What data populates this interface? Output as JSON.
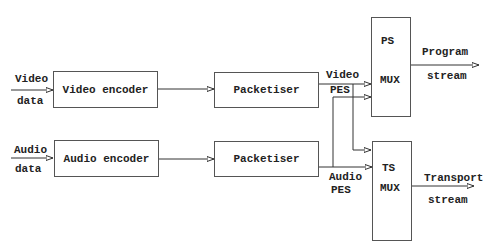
{
  "diagram": {
    "title": "",
    "inputs": {
      "video": {
        "line1": "Video",
        "line2": "data"
      },
      "audio": {
        "line1": "Audio",
        "line2": "data"
      }
    },
    "blocks": {
      "video_encoder": "Video encoder",
      "audio_encoder": "Audio encoder",
      "video_packetiser": "Packetiser",
      "audio_packetiser": "Packetiser",
      "ps_mux": {
        "line1": "PS",
        "line2": "MUX"
      },
      "ts_mux": {
        "line1": "TS",
        "line2": "MUX"
      }
    },
    "edges": {
      "video_pes": {
        "line1": "Video",
        "line2": "PES"
      },
      "audio_pes": {
        "line1": "Audio",
        "line2": "PES"
      }
    },
    "outputs": {
      "program": {
        "line1": "Program",
        "line2": "stream"
      },
      "transport": {
        "line1": "Transport",
        "line2": "stream"
      }
    },
    "connections": [
      [
        "video_data",
        "video_encoder"
      ],
      [
        "video_encoder",
        "video_packetiser"
      ],
      [
        "video_packetiser",
        "ps_mux"
      ],
      [
        "video_packetiser",
        "ts_mux"
      ],
      [
        "audio_data",
        "audio_encoder"
      ],
      [
        "audio_encoder",
        "audio_packetiser"
      ],
      [
        "audio_packetiser",
        "ps_mux"
      ],
      [
        "audio_packetiser",
        "ts_mux"
      ],
      [
        "ps_mux",
        "program_stream"
      ],
      [
        "ts_mux",
        "transport_stream"
      ]
    ],
    "colors": {
      "line": "#333333",
      "text": "#222222",
      "background": "#ffffff"
    }
  }
}
